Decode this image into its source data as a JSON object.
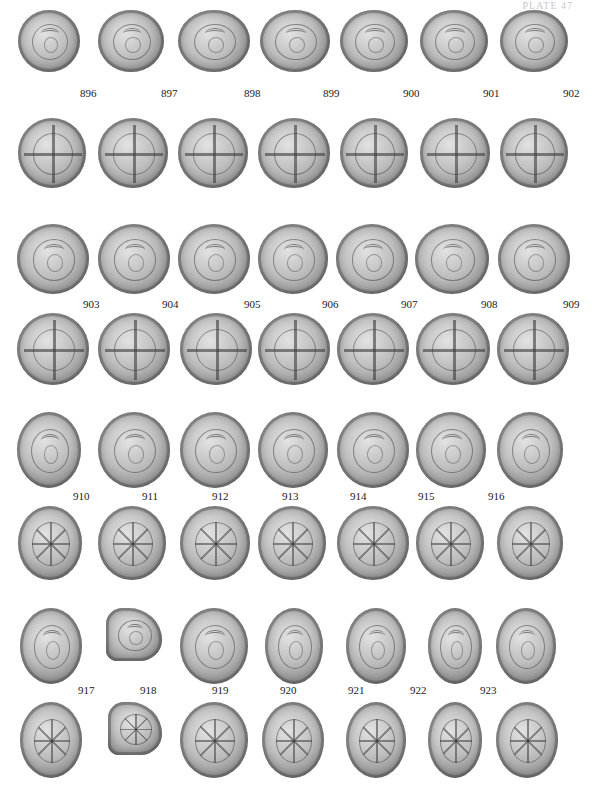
{
  "header": {
    "text": "PLATE 47"
  },
  "rows": [
    {
      "y": 10,
      "h": 62,
      "type": "bust",
      "label_y": 87,
      "coins": [
        {
          "x": 18,
          "w": 62,
          "label": "896",
          "lx": 80
        },
        {
          "x": 98,
          "w": 66,
          "label": "897",
          "lx": 161
        },
        {
          "x": 178,
          "w": 72,
          "label": "898",
          "lx": 244
        },
        {
          "x": 260,
          "w": 70,
          "label": "899",
          "lx": 323
        },
        {
          "x": 340,
          "w": 68,
          "label": "900",
          "lx": 403
        },
        {
          "x": 420,
          "w": 68,
          "label": "901",
          "lx": 483
        },
        {
          "x": 500,
          "w": 68,
          "label": "902",
          "lx": 563
        }
      ]
    },
    {
      "y": 118,
      "h": 70,
      "type": "cross",
      "coins": [
        {
          "x": 18,
          "w": 68
        },
        {
          "x": 98,
          "w": 70
        },
        {
          "x": 178,
          "w": 70
        },
        {
          "x": 258,
          "w": 72
        },
        {
          "x": 340,
          "w": 68
        },
        {
          "x": 420,
          "w": 70
        },
        {
          "x": 500,
          "w": 68
        }
      ]
    },
    {
      "y": 224,
      "h": 70,
      "type": "bust",
      "label_y": 298,
      "coins": [
        {
          "x": 17,
          "w": 72,
          "label": "903",
          "lx": 83
        },
        {
          "x": 98,
          "w": 72,
          "label": "904",
          "lx": 162
        },
        {
          "x": 178,
          "w": 72,
          "label": "905",
          "lx": 244
        },
        {
          "x": 258,
          "w": 70,
          "label": "906",
          "lx": 322
        },
        {
          "x": 336,
          "w": 72,
          "label": "907",
          "lx": 401
        },
        {
          "x": 415,
          "w": 74,
          "label": "908",
          "lx": 481
        },
        {
          "x": 498,
          "w": 72,
          "label": "909",
          "lx": 563
        }
      ]
    },
    {
      "y": 313,
      "h": 72,
      "type": "cross",
      "coins": [
        {
          "x": 17,
          "w": 72
        },
        {
          "x": 98,
          "w": 72
        },
        {
          "x": 180,
          "w": 72
        },
        {
          "x": 258,
          "w": 72
        },
        {
          "x": 337,
          "w": 72
        },
        {
          "x": 416,
          "w": 74
        },
        {
          "x": 497,
          "w": 72
        }
      ]
    },
    {
      "y": 412,
      "h": 76,
      "type": "bust",
      "label_y": 490,
      "coins": [
        {
          "x": 17,
          "w": 64,
          "label": "910",
          "lx": 73
        },
        {
          "x": 98,
          "w": 72,
          "label": "911",
          "lx": 142
        },
        {
          "x": 180,
          "w": 70,
          "label": "912",
          "lx": 212
        },
        {
          "x": 258,
          "w": 70,
          "label": "913",
          "lx": 282
        },
        {
          "x": 337,
          "w": 72,
          "label": "914",
          "lx": 350
        },
        {
          "x": 416,
          "w": 70,
          "label": "915",
          "lx": 418
        },
        {
          "x": 497,
          "w": 66,
          "label": "916",
          "lx": 488
        }
      ]
    },
    {
      "y": 506,
      "h": 74,
      "type": "star",
      "coins": [
        {
          "x": 18,
          "w": 64
        },
        {
          "x": 98,
          "w": 68
        },
        {
          "x": 180,
          "w": 70
        },
        {
          "x": 258,
          "w": 68
        },
        {
          "x": 337,
          "w": 72
        },
        {
          "x": 416,
          "w": 68
        },
        {
          "x": 497,
          "w": 66
        }
      ]
    },
    {
      "y": 608,
      "h": 76,
      "type": "bust",
      "label_y": 684,
      "coins": [
        {
          "x": 20,
          "w": 62,
          "label": "917",
          "lx": 78
        },
        {
          "x": 106,
          "w": 56,
          "label": "918",
          "lx": 140,
          "frag": true
        },
        {
          "x": 180,
          "w": 68,
          "label": "919",
          "lx": 212
        },
        {
          "x": 265,
          "w": 58,
          "label": "920",
          "lx": 280
        },
        {
          "x": 346,
          "w": 60,
          "label": "921",
          "lx": 348
        },
        {
          "x": 428,
          "w": 54,
          "label": "922",
          "lx": 410
        },
        {
          "x": 496,
          "w": 60,
          "label": "923",
          "lx": 480
        }
      ]
    },
    {
      "y": 702,
      "h": 76,
      "type": "star",
      "coins": [
        {
          "x": 20,
          "w": 62
        },
        {
          "x": 108,
          "w": 54,
          "frag": true
        },
        {
          "x": 180,
          "w": 68
        },
        {
          "x": 262,
          "w": 62
        },
        {
          "x": 346,
          "w": 60
        },
        {
          "x": 428,
          "w": 54
        },
        {
          "x": 496,
          "w": 62
        }
      ]
    }
  ]
}
